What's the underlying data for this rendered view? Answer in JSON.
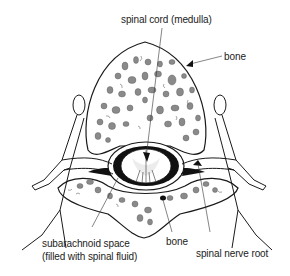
{
  "diagram": {
    "labels": {
      "spinal_cord": "spinal cord (medulla)",
      "bone_top": "bone",
      "subarachnoid_line1": "subarachnoid space",
      "subarachnoid_line2": "(filled with spinal fluid)",
      "bone_bottom": "bone",
      "nerve_root": "spinal nerve root"
    },
    "colors": {
      "line": "#1a1a1a",
      "bone_fill": "#ffffff",
      "spongy_bone": "#8a8a8a",
      "dark_space": "#111111",
      "leader": "#333333"
    }
  }
}
